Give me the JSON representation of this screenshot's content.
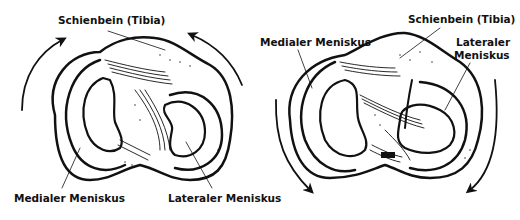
{
  "left_figure": {
    "labels": {
      "tibia": "Schienbein (Tibia)",
      "medial": "Medialer Meniskus",
      "lateral": "Lateraler Meniskus"
    },
    "arrows": "rotation-upward"
  },
  "right_figure": {
    "labels": {
      "tibia": "Schienbein (Tibia)",
      "medial": "Medialer Meniskus",
      "lateral_line1": "Lateraler",
      "lateral_line2": "Meniskus"
    },
    "arrows": "rotation-downward"
  },
  "colors": {
    "ink": "#111111",
    "background": "#ffffff"
  }
}
